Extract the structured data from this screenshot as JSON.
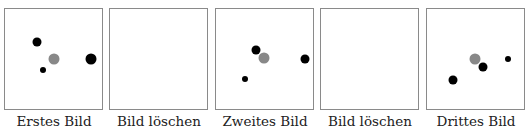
{
  "frames": [
    {
      "caption": "Erstes Bild",
      "dots": [
        {
          "x": 0.33,
          "y": 0.33,
          "size": "medium",
          "color": "#000000"
        },
        {
          "x": 0.5,
          "y": 0.5,
          "size": "large",
          "color": "#888888"
        },
        {
          "x": 0.89,
          "y": 0.5,
          "size": "large",
          "color": "#000000"
        },
        {
          "x": 0.39,
          "y": 0.61,
          "size": "small",
          "color": "#000000"
        }
      ]
    },
    {
      "caption": "Bild löschen",
      "dots": []
    },
    {
      "caption": "Zweites Bild",
      "dots": [
        {
          "x": 0.41,
          "y": 0.41,
          "size": "medium",
          "color": "#000000"
        },
        {
          "x": 0.49,
          "y": 0.49,
          "size": "large",
          "color": "#888888"
        },
        {
          "x": 0.92,
          "y": 0.5,
          "size": "medium",
          "color": "#000000"
        },
        {
          "x": 0.3,
          "y": 0.7,
          "size": "small",
          "color": "#000000"
        }
      ]
    },
    {
      "caption": "Bild löschen",
      "dots": []
    },
    {
      "caption": "Drittes Bild",
      "dots": [
        {
          "x": 0.49,
          "y": 0.5,
          "size": "large",
          "color": "#888888"
        },
        {
          "x": 0.58,
          "y": 0.58,
          "size": "medium",
          "color": "#000000"
        },
        {
          "x": 0.84,
          "y": 0.5,
          "size": "small",
          "color": "#000000"
        },
        {
          "x": 0.27,
          "y": 0.71,
          "size": "medium",
          "color": "#000000"
        }
      ]
    }
  ]
}
